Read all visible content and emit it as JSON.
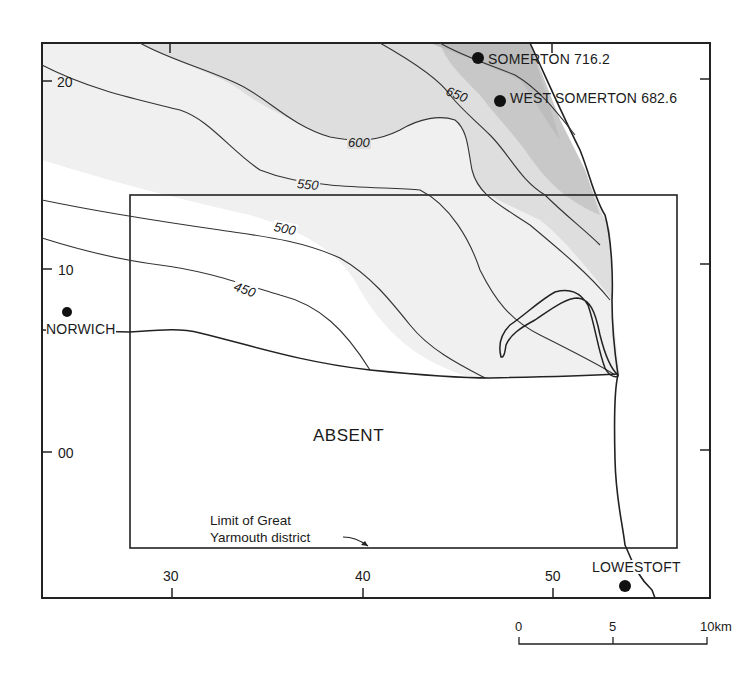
{
  "map": {
    "title": "",
    "area_label": "ABSENT",
    "district_note": {
      "line1": "Limit of Great",
      "line2": "Yarmouth district"
    },
    "places": [
      {
        "name": "SOMERTON 716.2"
      },
      {
        "name": "WEST SOMERTON 682.6"
      },
      {
        "name": "NORWICH"
      },
      {
        "name": "LOWESTOFT"
      }
    ],
    "contours": [
      {
        "value": "450"
      },
      {
        "value": "500"
      },
      {
        "value": "550"
      },
      {
        "value": "600"
      },
      {
        "value": "650"
      }
    ],
    "grid": {
      "x_ticks": [
        "30",
        "40",
        "50"
      ],
      "y_ticks": [
        "20",
        "10",
        "00"
      ]
    },
    "scale_bar": {
      "labels": [
        "0",
        "5",
        "10km"
      ]
    },
    "colors": {
      "shade_light": "#efefef",
      "shade_mid": "#dcdcdc",
      "shade_dark": "#c4c4c4",
      "line": "#222222"
    }
  }
}
